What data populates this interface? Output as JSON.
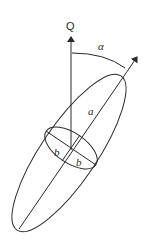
{
  "diagram": {
    "type": "geometric-figure",
    "labels": {
      "vertical_axis": "Q",
      "angle": "α",
      "semi_major": "a",
      "semi_minor_left": "b",
      "semi_minor_right": "b"
    },
    "colors": {
      "line": "#2a2a2a",
      "background": "#ffffff"
    },
    "geometry": {
      "center": [
        71,
        148
      ],
      "vertical_axis_top": [
        71,
        36
      ],
      "major_axis_tip": [
        137,
        56
      ],
      "major_axis_bottom": [
        19,
        229
      ],
      "tilt_degrees": 34
    }
  }
}
